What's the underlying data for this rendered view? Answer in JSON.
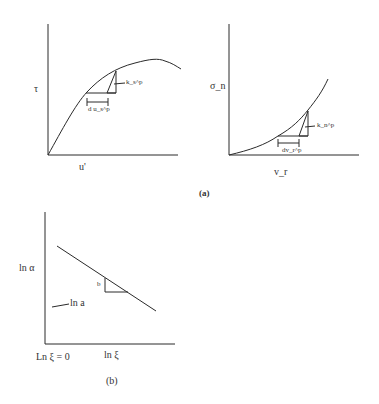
{
  "figure": {
    "panel_a": {
      "caption": "(a)",
      "left_chart": {
        "y_label": "τ",
        "x_label": "u'",
        "increment_label": "d u_s^p",
        "stiffness_label": "k_s^p"
      },
      "right_chart": {
        "y_label": "σ_n",
        "x_label": "v_r",
        "increment_label": "dv_r^p",
        "stiffness_label": "k_n^p"
      }
    },
    "panel_b": {
      "caption": "(b)",
      "y_label": "ln α",
      "x_label": "ln ξ",
      "origin_label": "Ln ξ = 0",
      "intercept_label": "ln a",
      "slope_label": "b"
    },
    "colors": {
      "line": "#2a2a2a",
      "background": "#ffffff"
    }
  }
}
